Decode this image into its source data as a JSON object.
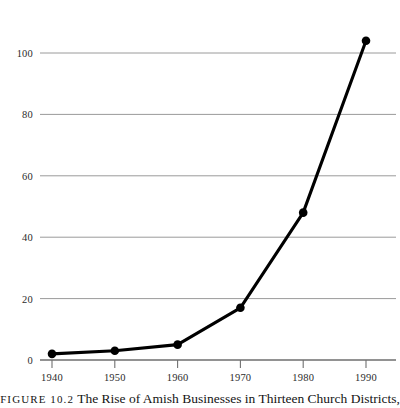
{
  "caption": {
    "figure_label": "FIGURE 10.2",
    "text": "The Rise of Amish Businesses in Thirteen Church Districts,"
  },
  "chart_data": {
    "type": "line",
    "title": "",
    "subtitle": "",
    "xlabel": "",
    "ylabel": "",
    "x": [
      1940,
      1950,
      1960,
      1970,
      1980,
      1990
    ],
    "categories": [
      "1940",
      "1950",
      "1960",
      "1970",
      "1980",
      "1990"
    ],
    "values": [
      2,
      3,
      5,
      17,
      48,
      104
    ],
    "series": [
      {
        "name": "Amish businesses",
        "values": [
          2,
          3,
          5,
          17,
          48,
          104
        ]
      }
    ],
    "xlim": [
      1936,
      1994
    ],
    "ylim": [
      0,
      110
    ],
    "yticks": [
      0,
      20,
      40,
      60,
      80,
      100
    ],
    "ytick_labels": [
      "0",
      "20",
      "40",
      "60",
      "80",
      "100"
    ],
    "xticks": [
      1940,
      1950,
      1960,
      1970,
      1980,
      1990
    ],
    "xtick_labels": [
      "1940",
      "1950",
      "1960",
      "1970",
      "1980",
      "1990"
    ],
    "grid": "horizontal",
    "legend": "none",
    "marker": "filled-circle",
    "line_color": "#000000",
    "grid_color": "#9a9a9a",
    "axis_color": "#707070"
  }
}
